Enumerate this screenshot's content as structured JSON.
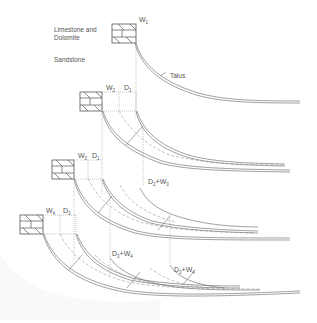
{
  "diagram": {
    "type": "geologic-cross-section-sequence",
    "stages": 4,
    "labels": {
      "caprock": "Limestone and Dolomite",
      "caprock_line1": "Limestone and",
      "caprock_line2": "Dolomite",
      "base": "Sandstone",
      "talus": "Talus"
    },
    "stage_labels": [
      {
        "stage": 1,
        "w": "W",
        "w_sub": "1"
      },
      {
        "stage": 2,
        "w": "W",
        "w_sub": "2",
        "d": "D",
        "d_sub": "1",
        "sum": {
          "d": "D",
          "d_sub": "2",
          "plus": "+",
          "w": "W",
          "w_sub": "3"
        }
      },
      {
        "stage": 3,
        "w": "W",
        "w_sub": "3",
        "d": "D",
        "d_sub": "1"
      },
      {
        "stage": 4,
        "w": "W",
        "w_sub": "4",
        "d": "D",
        "d_sub": "3",
        "sums": [
          {
            "d": "D",
            "d_sub": "3",
            "plus": "+",
            "w": "W",
            "w_sub": "4"
          },
          {
            "d": "D",
            "d_sub": "3",
            "plus": "+",
            "w": "W",
            "w_sub": "4"
          }
        ]
      }
    ],
    "colors": {
      "line": "#777777",
      "text": "#555555",
      "background": "#ffffff"
    }
  }
}
